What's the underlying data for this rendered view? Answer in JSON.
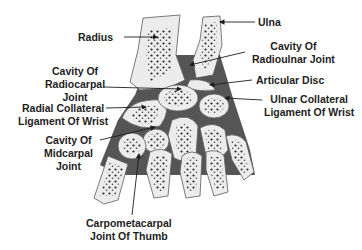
{
  "colors": {
    "bone_fill": "#ececec",
    "bone_stroke": "#5a5a5a",
    "tissue": "#555555",
    "dots": "#2a2a2a",
    "text": "#1d1d1d",
    "leader": "#1d1d1d"
  },
  "labels": {
    "radius": [
      "Radius"
    ],
    "ulna": [
      "Ulna"
    ],
    "cavity_radioulnar": [
      "Cavity Of",
      "Radioulnar Joint"
    ],
    "cavity_radiocarpal": [
      "Cavity Of",
      "Radiocarpal",
      "Joint"
    ],
    "articular_disc": [
      "Articular Disc"
    ],
    "radial_collateral": [
      "Radial Collateral",
      "Ligament Of Wrist"
    ],
    "ulnar_collateral": [
      "Ulnar Collateral",
      "Ligament Of Wrist"
    ],
    "cavity_midcarpal": [
      "Cavity Of",
      "Midcarpal",
      "Joint"
    ],
    "carpometacarpal_thumb": [
      "Carpometacarpal",
      "Joint Of Thumb"
    ]
  }
}
